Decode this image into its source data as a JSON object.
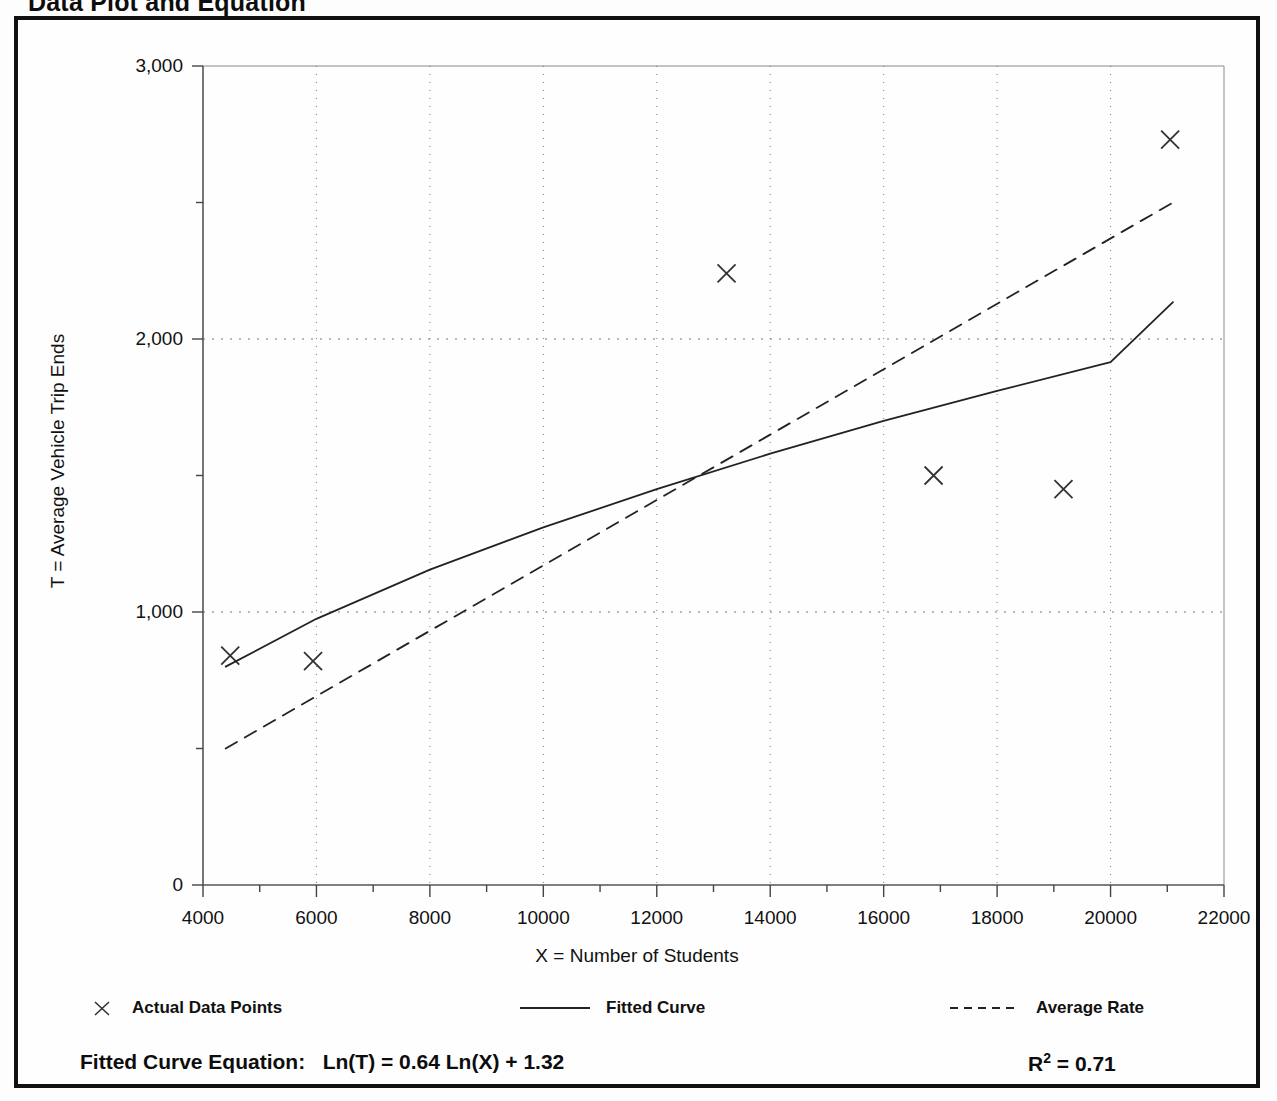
{
  "document": {
    "title": "Data Plot and Equation"
  },
  "chart_data": {
    "type": "scatter",
    "title": "Data Plot and Equation",
    "xlabel": "X = Number of Students",
    "ylabel": "T = Average Vehicle Trip Ends",
    "xlim": [
      4000,
      22000
    ],
    "ylim": [
      0,
      3000
    ],
    "grid": true,
    "x_major_ticks": [
      4000,
      6000,
      8000,
      10000,
      12000,
      14000,
      16000,
      18000,
      20000,
      22000
    ],
    "x_tick_labels": [
      "4000",
      "6000",
      "8000",
      "10000",
      "12000",
      "14000",
      "16000",
      "18000",
      "20000",
      "22000"
    ],
    "x_minor_step": 1000,
    "y_major_ticks": [
      0,
      1000,
      2000,
      3000
    ],
    "y_tick_labels": [
      "0",
      "1,000",
      "2,000",
      "3,000"
    ],
    "y_minor_step": 500,
    "series": [
      {
        "name": "Actual Data Points",
        "type": "scatter",
        "marker": "x",
        "color": "#333333",
        "points": [
          {
            "x": 4480,
            "y": 840
          },
          {
            "x": 5940,
            "y": 820
          },
          {
            "x": 13230,
            "y": 2240
          },
          {
            "x": 16880,
            "y": 1500
          },
          {
            "x": 19170,
            "y": 1450
          },
          {
            "x": 21050,
            "y": 2730
          }
        ]
      },
      {
        "name": "Fitted Curve",
        "type": "line",
        "style": "solid",
        "color": "#222222",
        "equation": "Ln(T) = 0.64 Ln(X) + 1.32",
        "points": [
          {
            "x": 4400,
            "y": 800
          },
          {
            "x": 6000,
            "y": 975
          },
          {
            "x": 8000,
            "y": 1155
          },
          {
            "x": 10000,
            "y": 1310
          },
          {
            "x": 12000,
            "y": 1450
          },
          {
            "x": 14000,
            "y": 1580
          },
          {
            "x": 16000,
            "y": 1700
          },
          {
            "x": 18000,
            "y": 1810
          },
          {
            "x": 20000,
            "y": 1915
          },
          {
            "x": 21100,
            "y": 2135
          }
        ]
      },
      {
        "name": "Average Rate",
        "type": "line",
        "style": "dashed",
        "color": "#222222",
        "points": [
          {
            "x": 4400,
            "y": 500
          },
          {
            "x": 21100,
            "y": 2500
          }
        ]
      }
    ],
    "annotations": [
      {
        "name": "fitted-curve-equation",
        "text": "Fitted Curve Equation:  Ln(T) = 0.64 Ln(X) + 1.32"
      },
      {
        "name": "r-squared",
        "text": "R2 = 0.71",
        "symbol": "R",
        "exponent": "2",
        "value": "= 0.71"
      }
    ],
    "legend": {
      "position": "bottom",
      "entries": [
        {
          "label": "Actual Data Points",
          "symbol": "marker-x"
        },
        {
          "label": "Fitted Curve",
          "symbol": "solid-line"
        },
        {
          "label": "Average Rate",
          "symbol": "dashed-line"
        }
      ]
    }
  },
  "equation_bar": {
    "fitted_label": "Fitted Curve Equation:",
    "fitted_equation": "Ln(T) = 0.64 Ln(X) + 1.32",
    "r_symbol": "R",
    "r_exponent": "2",
    "r_value": "= 0.71"
  }
}
